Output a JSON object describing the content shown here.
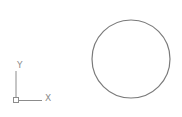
{
  "drawing": {
    "background": "#ffffff",
    "stroke_color": "#7a7a7a",
    "ucs_icon": {
      "x_label": "X",
      "y_label": "Y",
      "origin": [
        16,
        99
      ],
      "x_axis_end": [
        42,
        99
      ],
      "y_axis_end": [
        16,
        70
      ],
      "color": "#8c8c8c"
    },
    "circle": {
      "center": [
        131,
        59
      ],
      "radius": 39,
      "color": "#7a7a7a"
    }
  }
}
